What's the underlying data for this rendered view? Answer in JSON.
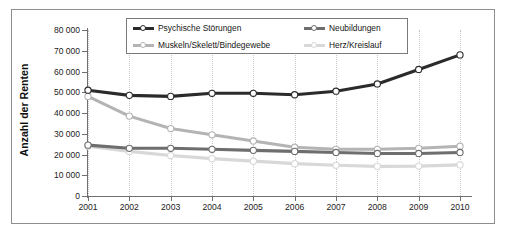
{
  "chart_data": {
    "type": "line",
    "title": "",
    "xlabel": "",
    "ylabel": "Anzahl der Renten",
    "x": [
      "2001",
      "2002",
      "2003",
      "2004",
      "2005",
      "2006",
      "2007",
      "2008",
      "2009",
      "2010"
    ],
    "ylim": [
      0,
      80000
    ],
    "yticks": [
      0,
      10000,
      20000,
      30000,
      40000,
      50000,
      60000,
      70000,
      80000
    ],
    "ytick_labels": [
      "0",
      "10 000",
      "20 000",
      "30 000",
      "40 000",
      "50 000",
      "60 000",
      "70 000",
      "80 000"
    ],
    "grid": "vertical-dotted",
    "legend_position": "top-center",
    "series": [
      {
        "name": "Psychische Störungen",
        "color": "#2b2b2b",
        "values": [
          51000,
          48500,
          48000,
          49500,
          49500,
          48800,
          50500,
          54000,
          61000,
          68000
        ]
      },
      {
        "name": "Muskeln/Skelett/Bindegewebe",
        "color": "#b4b4b4",
        "values": [
          48000,
          38500,
          32500,
          29500,
          26500,
          23500,
          22500,
          22500,
          23000,
          24000
        ]
      },
      {
        "name": "Neubildungen",
        "color": "#6e6e6e",
        "values": [
          24500,
          23000,
          23000,
          22500,
          22000,
          21500,
          21000,
          20500,
          20500,
          21000
        ]
      },
      {
        "name": "Herz/Kreislauf",
        "color": "#d8d8d8",
        "values": [
          24000,
          21500,
          19500,
          18000,
          16800,
          15600,
          14800,
          14300,
          14400,
          15000
        ]
      }
    ]
  },
  "legend": {
    "entries": [
      {
        "label": "Psychische Störungen"
      },
      {
        "label": "Neubildungen"
      },
      {
        "label": "Muskeln/Skelett/Bindegewebe"
      },
      {
        "label": "Herz/Kreislauf"
      }
    ]
  }
}
